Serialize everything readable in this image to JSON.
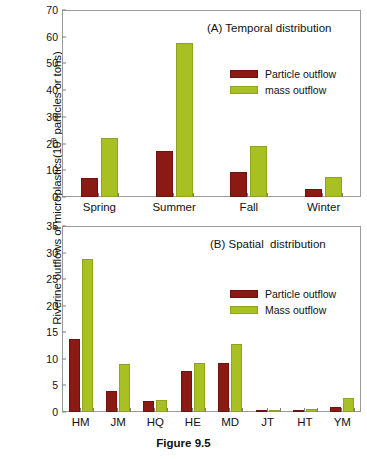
{
  "figure": {
    "caption": "Figure 9.5",
    "y_axis_title_main": "Riverine outflows of microplastics(10",
    "y_axis_title_sup": "9",
    "y_axis_title_tail": " particles or tons)",
    "colors": {
      "particle": "#8B1A14",
      "mass": "#A8C022",
      "frame": "#9a9a9a",
      "text": "#111111",
      "background": "#ffffff"
    }
  },
  "chart_data": [
    {
      "type": "bar",
      "panel": "A",
      "title": "(A) Temporal distribution",
      "categories": [
        "Spring",
        "Summer",
        "Fall",
        "Winter"
      ],
      "series": [
        {
          "name": "Particle outflow",
          "color": "#8B1A14",
          "values": [
            7.3,
            17.1,
            9.5,
            2.9
          ]
        },
        {
          "name": "mass outflow",
          "color": "#A8C022",
          "values": [
            22.0,
            57.5,
            19.0,
            7.5
          ]
        }
      ],
      "xlabel": "",
      "ylabel": "Riverine outflows of microplastics(10^9 particles or tons)",
      "ylim": [
        0,
        70
      ],
      "yticks": [
        0,
        10,
        20,
        30,
        40,
        50,
        60,
        70
      ],
      "grid": false,
      "legend_position": "upper-right-inside"
    },
    {
      "type": "bar",
      "panel": "B",
      "title": "(B) Spatial  distribution",
      "categories": [
        "HM",
        "JM",
        "HQ",
        "HE",
        "MD",
        "JT",
        "HT",
        "YM"
      ],
      "series": [
        {
          "name": "Particle outflow",
          "color": "#8B1A14",
          "values": [
            13.8,
            3.9,
            2.1,
            7.7,
            9.2,
            0.35,
            0.45,
            1.0
          ]
        },
        {
          "name": "Mass outflow",
          "color": "#A8C022",
          "values": [
            28.8,
            9.1,
            2.3,
            9.2,
            12.8,
            0.3,
            0.5,
            2.6
          ]
        }
      ],
      "xlabel": "",
      "ylabel": "Riverine outflows of microplastics(10^9 particles or tons)",
      "ylim": [
        0,
        35
      ],
      "yticks": [
        0,
        5,
        10,
        15,
        20,
        25,
        30,
        35
      ],
      "grid": false,
      "legend_position": "upper-right-inside"
    }
  ]
}
